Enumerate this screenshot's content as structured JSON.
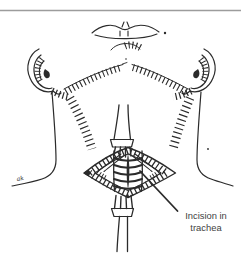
{
  "colors": {
    "background": "#ffffff",
    "ink": "#2b2b2b",
    "rule": "#9c9c9c",
    "label_text": "#424242"
  },
  "figure": {
    "annotation": {
      "line1": "Incision in",
      "line2": "trachea"
    },
    "signature": "ak"
  }
}
